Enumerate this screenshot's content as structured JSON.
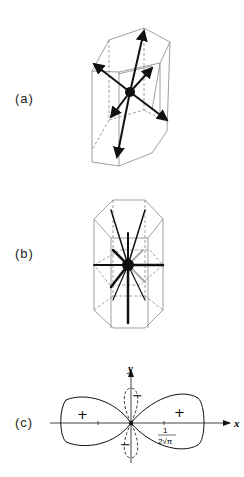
{
  "panels": [
    {
      "id": "a",
      "label": "(a)",
      "description": "Hexagonal prism with central atom and bond arrows"
    },
    {
      "id": "b",
      "label": "(b)",
      "description": "Hexagonal prism with central atom and radial bonds"
    },
    {
      "id": "c",
      "label": "(c)",
      "description": "Angular function polar plot with lobes"
    }
  ],
  "plot_c": {
    "x_axis_label": "x",
    "y_axis_label": "y",
    "left_lobe_sign": "+",
    "right_lobe_sign": "+",
    "upper_lobe_sign": "−",
    "lower_lobe_sign": "−",
    "tick_label_numerator": "1",
    "tick_label_denominator": "2√π"
  },
  "colors": {
    "line": "#111111",
    "thin_line": "#777777",
    "background": "#ffffff"
  }
}
